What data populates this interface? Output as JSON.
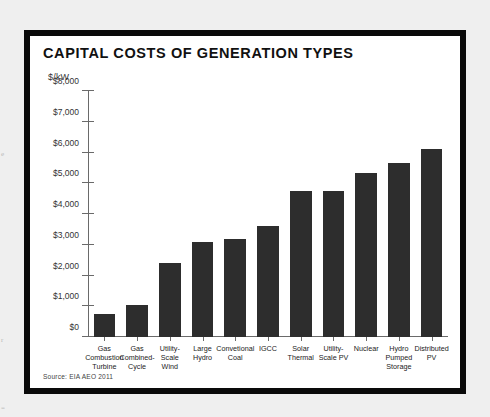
{
  "page": {
    "background_color": "#efefef",
    "frame_color": "#0a0a0a",
    "edge_fragments": [
      "e",
      "r",
      "="
    ]
  },
  "chart_data": {
    "type": "bar",
    "title": "CAPITAL COSTS OF GENERATION TYPES",
    "xlabel": "",
    "ylabel": "$/kW",
    "ylim": [
      0,
      8000
    ],
    "grid": false,
    "legend": null,
    "bar_color": "#2d2d2d",
    "source": "Source: EIA AEO 2011",
    "ytick_labels": [
      "$0",
      "$1,000",
      "$2,000",
      "$3,000",
      "$4,000",
      "$5,000",
      "$6,000",
      "$7,000",
      "$8,000"
    ],
    "ytick_values": [
      0,
      1000,
      2000,
      3000,
      4000,
      5000,
      6000,
      7000,
      8000
    ],
    "categories": [
      "Gas\nCombustion\nTurbine",
      "Gas\nCombined-\nCycle",
      "Utility-\nScale\nWind",
      "Large\nHydro",
      "Convetional\nCoal",
      "IGCC",
      "Solar\nThermal",
      "Utility-\nScale PV",
      "Nuclear",
      "Hydro\nPumped\nStorage",
      "Distributed\nPV"
    ],
    "values": [
      750,
      1050,
      2400,
      3100,
      3200,
      3600,
      4750,
      4750,
      5350,
      5650,
      6100
    ]
  }
}
